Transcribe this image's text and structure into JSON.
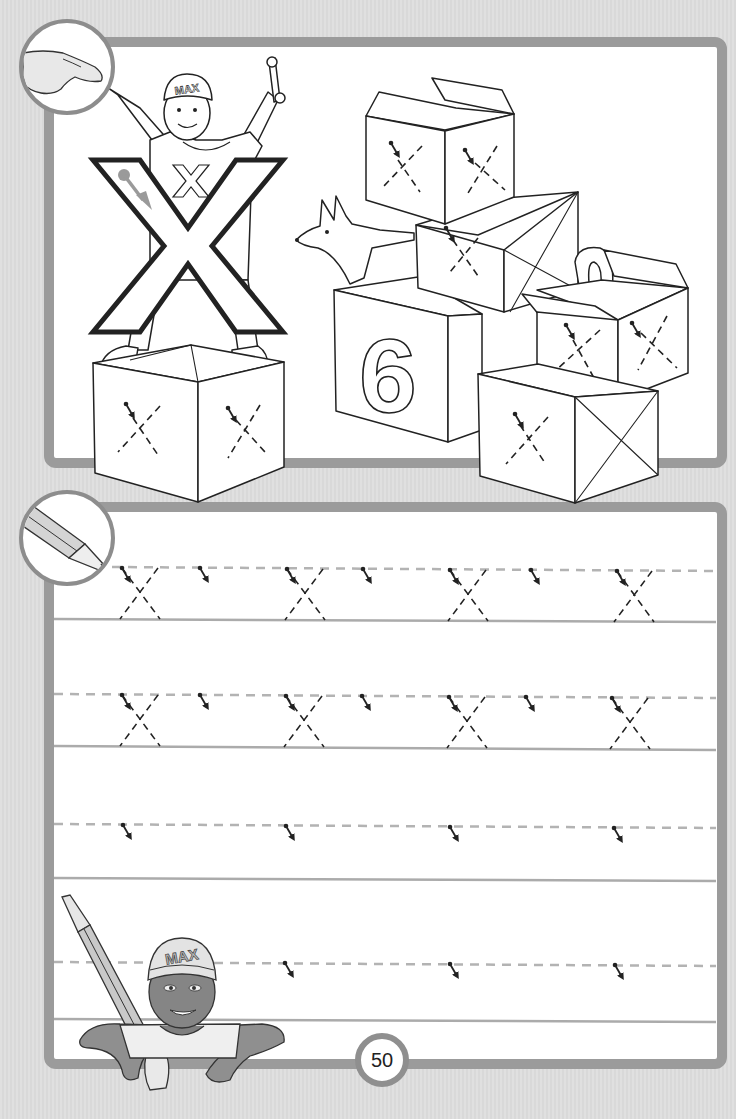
{
  "page": {
    "letter": "X",
    "lowercase_letter": "x",
    "page_number": "50",
    "colors": {
      "background": "#dddddd",
      "frame": "#9b9b9b",
      "panel": "#ffffff",
      "guide_dashed": "#b3b3b3",
      "guide_base": "#ababab",
      "ink": "#222222"
    }
  },
  "top_panel": {
    "instruction_icon": "pointing-hand-icon",
    "character": {
      "cap_text": "MAX",
      "shirt_letter": "x",
      "holding": "wrench-icon"
    },
    "big_letter": "X",
    "boxes": [
      {
        "name": "box-under-max",
        "traces": 2
      },
      {
        "name": "box-top-stack",
        "traces": 2
      },
      {
        "name": "box-middle-stack",
        "traces": 1
      },
      {
        "name": "block-six",
        "label": "6"
      },
      {
        "name": "box-open-right",
        "traces": 2
      },
      {
        "name": "box-bottom-right",
        "traces": 1
      }
    ],
    "animal": "fox-icon"
  },
  "bottom_panel": {
    "instruction_icon": "pencil-icon",
    "rows": [
      {
        "index": 1,
        "traced_letters": [
          "x",
          "x",
          "x",
          "x"
        ],
        "start_arrows": 7
      },
      {
        "index": 2,
        "traced_letters": [
          "x",
          "x",
          "x",
          "x"
        ],
        "start_arrows": 7
      },
      {
        "index": 3,
        "traced_letters": [],
        "start_arrows": 4
      },
      {
        "index": 4,
        "traced_letters": [],
        "start_arrows": 3
      }
    ],
    "character": {
      "cap_text": "MAX",
      "holding": "pencil-icon"
    }
  }
}
